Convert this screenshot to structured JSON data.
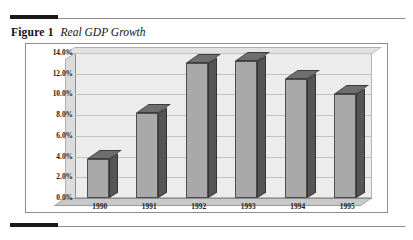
{
  "figure": {
    "label": "Figure 1",
    "title": "Real GDP Growth"
  },
  "chart_data": {
    "type": "bar",
    "title": "Real GDP Growth",
    "xlabel": "",
    "ylabel": "",
    "categories": [
      "1990",
      "1991",
      "1992",
      "1993",
      "1994",
      "1995"
    ],
    "values": [
      3.8,
      8.2,
      13.0,
      13.2,
      11.5,
      10.0
    ],
    "value_labels": [
      "3.8%",
      "8.2%",
      "13.0%",
      "13.2%",
      "11.5%",
      "10.0%"
    ],
    "ylim": [
      0,
      14
    ],
    "ytick_labels": [
      "0.0%",
      "2.0%",
      "4.0%",
      "6.0%",
      "8.0%",
      "10.0%",
      "12.0%",
      "14.0%"
    ],
    "ytick_values": [
      0,
      2,
      4,
      6,
      8,
      10,
      12,
      14
    ],
    "grid": true,
    "legend": "none",
    "style": "3d-column",
    "colors": {
      "bar_face": "#a9a9a9",
      "bar_side": "#555555",
      "bar_top": "#6e6e6e",
      "plot_background": "#ececec",
      "gridline": "#c2c2c2",
      "axis": "#8f8f8f",
      "rule": "#1a1a1a"
    }
  }
}
